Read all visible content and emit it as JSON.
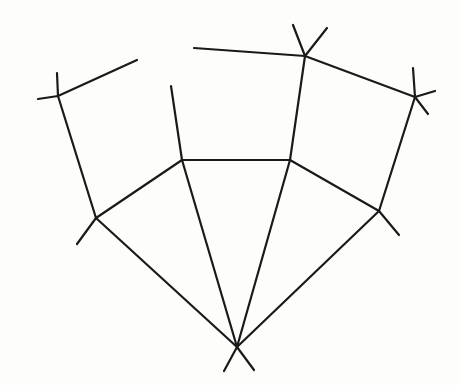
{
  "diagram": {
    "type": "planar-graph-line-drawing",
    "width": 460,
    "height": 385,
    "stroke_color": "#1a1a1a",
    "background": "#fdfdfc",
    "nodes": [
      {
        "id": "A",
        "x": 58,
        "y": 96
      },
      {
        "id": "B",
        "x": 96,
        "y": 218
      },
      {
        "id": "C",
        "x": 182,
        "y": 160
      },
      {
        "id": "D",
        "x": 290,
        "y": 160
      },
      {
        "id": "E",
        "x": 305,
        "y": 56
      },
      {
        "id": "F",
        "x": 415,
        "y": 97
      },
      {
        "id": "G",
        "x": 379,
        "y": 211
      },
      {
        "id": "H",
        "x": 237,
        "y": 347
      }
    ],
    "edges": [
      {
        "from": "A",
        "to": "B"
      },
      {
        "from": "B",
        "to": "C"
      },
      {
        "from": "C",
        "to": "D"
      },
      {
        "from": "D",
        "to": "G"
      },
      {
        "from": "D",
        "to": "E"
      },
      {
        "from": "E",
        "to": "F"
      },
      {
        "from": "F",
        "to": "G"
      },
      {
        "from": "B",
        "to": "H"
      },
      {
        "from": "C",
        "to": "H"
      },
      {
        "from": "D",
        "to": "H"
      },
      {
        "from": "G",
        "to": "H"
      }
    ],
    "stubs": [
      {
        "node": "A",
        "x2": 38,
        "y2": 99
      },
      {
        "node": "A",
        "x2": 57,
        "y2": 73
      },
      {
        "node": "A",
        "x2": 137,
        "y2": 60
      },
      {
        "node": "B",
        "x2": 77,
        "y2": 244
      },
      {
        "node": "C",
        "x2": 171,
        "y2": 86
      },
      {
        "node": "E",
        "x2": 293,
        "y2": 25
      },
      {
        "node": "E",
        "x2": 327,
        "y2": 28
      },
      {
        "node": "E",
        "x2": 194,
        "y2": 48
      },
      {
        "node": "F",
        "x2": 413,
        "y2": 68
      },
      {
        "node": "F",
        "x2": 435,
        "y2": 91
      },
      {
        "node": "F",
        "x2": 428,
        "y2": 114
      },
      {
        "node": "G",
        "x2": 399,
        "y2": 235
      },
      {
        "node": "H",
        "x2": 224,
        "y2": 371
      },
      {
        "node": "H",
        "x2": 254,
        "y2": 370
      }
    ]
  }
}
